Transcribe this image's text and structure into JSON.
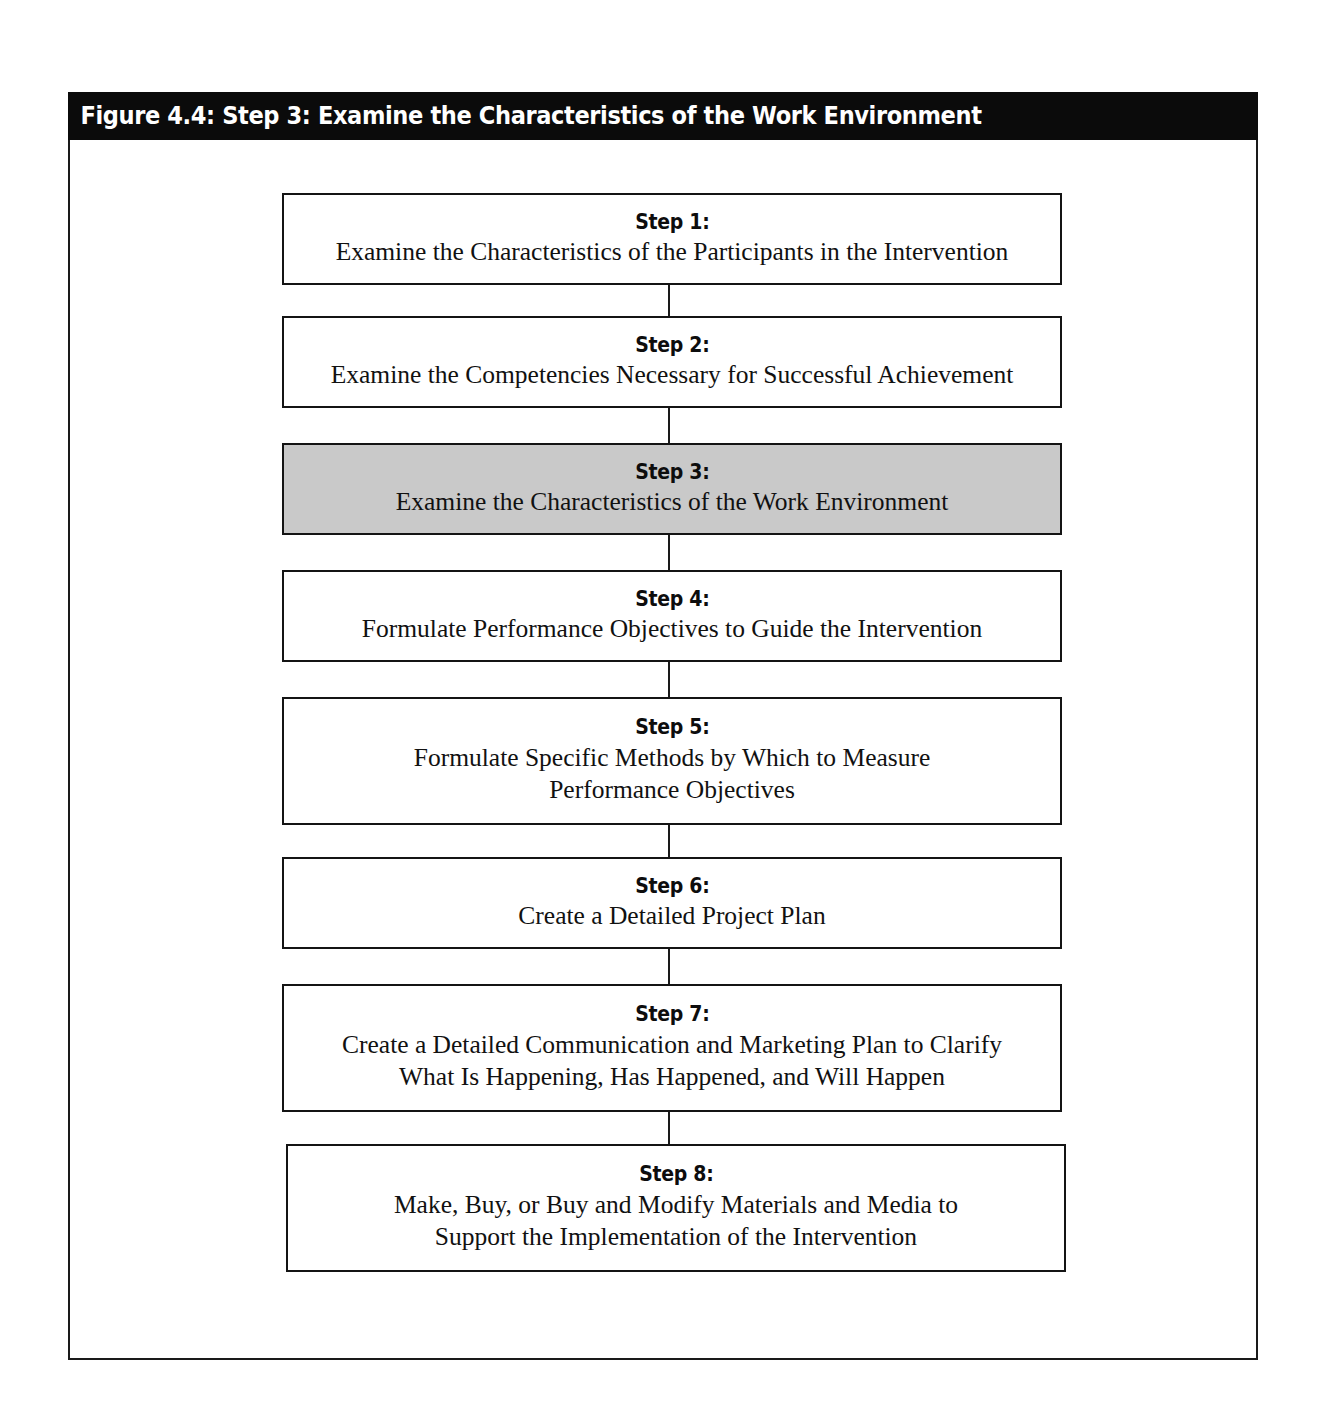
{
  "figure": {
    "title": "Figure 4.4: Step 3: Examine the Characteristics of the Work Environment",
    "highlighted_step_index": 2,
    "colors": {
      "title_bar_background": "#0b0b0b",
      "title_bar_text": "#ffffff",
      "frame_border": "#1a1a1a",
      "box_border": "#141414",
      "box_fill": "#ffffff",
      "highlight_fill": "#c9c9c9",
      "shadow": "#9c9c9c",
      "connector": "#1a1a1a"
    }
  },
  "chart_data": {
    "type": "flowchart",
    "title": "Figure 4.4: Step 3: Examine the Characteristics of the Work Environment",
    "orientation": "vertical",
    "connector_style": "straight-line",
    "highlighted": "Step 3:",
    "nodes": [
      {
        "label": "Step 1:",
        "description": "Examine the Characteristics of the Participants in the Intervention",
        "lines": 1,
        "highlighted": false
      },
      {
        "label": "Step 2:",
        "description": "Examine the Competencies Necessary for Successful Achievement",
        "lines": 1,
        "highlighted": false
      },
      {
        "label": "Step 3:",
        "description": "Examine the Characteristics of the Work Environment",
        "lines": 1,
        "highlighted": true
      },
      {
        "label": "Step 4:",
        "description": "Formulate Performance Objectives to Guide the Intervention",
        "lines": 1,
        "highlighted": false
      },
      {
        "label": "Step 5:",
        "description": "Formulate Specific Methods by Which to Measure\nPerformance Objectives",
        "lines": 2,
        "highlighted": false
      },
      {
        "label": "Step 6:",
        "description": "Create a Detailed Project Plan",
        "lines": 1,
        "highlighted": false
      },
      {
        "label": "Step 7:",
        "description": "Create a Detailed Communication and Marketing Plan to Clarify\nWhat Is Happening, Has Happened, and Will Happen",
        "lines": 2,
        "highlighted": false
      },
      {
        "label": "Step 8:",
        "description": "Make, Buy, or Buy and Modify Materials and Media to\nSupport the Implementation of the Intervention",
        "lines": 2,
        "highlighted": false
      }
    ]
  }
}
